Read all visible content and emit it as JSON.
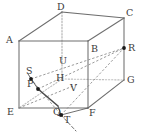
{
  "figure": {
    "type": "geometry-diagram",
    "shape": "rectangular-cuboid-with-internal-points",
    "width": 144,
    "height": 139,
    "background_color": "#ffffff",
    "stroke_color": "#6e6e6e",
    "hidden_stroke_color": "#b5b5b5",
    "label_color": "#3b3b3b",
    "point_color": "#1a1a1a"
  },
  "labels": {
    "A": "A",
    "B": "B",
    "C": "C",
    "D": "D",
    "E": "E",
    "F": "F",
    "G": "G",
    "H": "H",
    "P": "P",
    "Q": "Q",
    "R": "R",
    "S": "S",
    "T": "T",
    "U": "U",
    "V": "V"
  },
  "vertices": {
    "A": {
      "x": 19,
      "y": 41,
      "label": "A",
      "label_x": 6,
      "label_y": 36,
      "kind": "cuboid-corner",
      "visible": true
    },
    "B": {
      "x": 88,
      "y": 41,
      "label": "B",
      "label_x": 91,
      "label_y": 45,
      "kind": "cuboid-corner",
      "visible": true
    },
    "C": {
      "x": 124,
      "y": 18,
      "label": "C",
      "label_x": 127,
      "label_y": 9,
      "kind": "cuboid-corner",
      "visible": true
    },
    "D": {
      "x": 62,
      "y": 12,
      "label": "D",
      "label_x": 58,
      "label_y": 3,
      "kind": "cuboid-corner",
      "visible": true
    },
    "E": {
      "x": 19,
      "y": 108,
      "label": "E",
      "label_x": 7,
      "label_y": 107,
      "kind": "cuboid-corner",
      "visible": true
    },
    "F": {
      "x": 88,
      "y": 108,
      "label": "F",
      "label_x": 90,
      "label_y": 108,
      "kind": "cuboid-corner",
      "visible": true
    },
    "G": {
      "x": 124,
      "y": 80,
      "label": "G",
      "label_x": 127,
      "label_y": 76,
      "kind": "cuboid-corner",
      "visible": true
    },
    "H": {
      "x": 62,
      "y": 79,
      "label": "H",
      "label_x": 57,
      "label_y": 74,
      "kind": "cuboid-corner",
      "visible": false
    }
  },
  "points": {
    "P": {
      "x": 38,
      "y": 89,
      "label": "P",
      "label_x": 28,
      "label_y": 80,
      "dot": true
    },
    "Q": {
      "x": 58,
      "y": 106,
      "label": "Q",
      "label_x": 54,
      "label_y": 107,
      "dot": false
    },
    "R": {
      "x": 124,
      "y": 48,
      "label": "R",
      "label_x": 128,
      "label_y": 43,
      "dot": true
    },
    "S": {
      "x": 31,
      "y": 79,
      "label": "S",
      "label_x": 26,
      "label_y": 67,
      "dot": true
    },
    "T": {
      "x": 61,
      "y": 115,
      "label": "T",
      "label_x": 64,
      "label_y": 116,
      "dot": true
    },
    "U": {
      "x": 62,
      "y": 66,
      "label": "U",
      "label_x": 60,
      "label_y": 57,
      "dot": false
    },
    "V": {
      "x": 73,
      "y": 89,
      "label": "V",
      "label_x": 71,
      "label_y": 84,
      "dot": false
    }
  },
  "edges": {
    "solid": [
      {
        "from": "A",
        "to": "B",
        "name": "edge-AB"
      },
      {
        "from": "B",
        "to": "F",
        "name": "edge-BF"
      },
      {
        "from": "F",
        "to": "E",
        "name": "edge-FE"
      },
      {
        "from": "E",
        "to": "A",
        "name": "edge-EA"
      },
      {
        "from": "A",
        "to": "D",
        "name": "edge-AD"
      },
      {
        "from": "B",
        "to": "C",
        "name": "edge-BC"
      },
      {
        "from": "F",
        "to": "G",
        "name": "edge-FG"
      },
      {
        "from": "D",
        "to": "C",
        "name": "edge-DC"
      },
      {
        "from": "C",
        "to": "G",
        "name": "edge-CG"
      }
    ],
    "hidden": [
      {
        "from": "D",
        "to": "H",
        "name": "edge-DH"
      },
      {
        "from": "H",
        "to": "E",
        "name": "edge-HE"
      },
      {
        "from": "H",
        "to": "G",
        "name": "edge-HG"
      }
    ]
  },
  "construction_lines": {
    "dashed": [
      {
        "from": "S",
        "to": "R",
        "name": "line-SR"
      },
      {
        "from": "P",
        "to": "R",
        "name": "line-PR"
      },
      {
        "from": "T",
        "to": "R",
        "name": "line-TR"
      },
      {
        "from": "E",
        "to": "V",
        "name": "line-EV"
      },
      {
        "from": "S",
        "to": "T",
        "name": "line-ST"
      }
    ],
    "solid_thin": [
      {
        "from": "P",
        "to": "Q",
        "name": "line-PQ"
      },
      {
        "from": "Q",
        "to": "T",
        "name": "line-QT"
      },
      {
        "from": "T",
        "to": "F",
        "name": "line-TF"
      },
      {
        "from": "S",
        "to": "P",
        "name": "line-SP"
      }
    ],
    "tick": [
      {
        "from": "T",
        "to": "T_tail",
        "name": "line-T-tail"
      }
    ]
  }
}
